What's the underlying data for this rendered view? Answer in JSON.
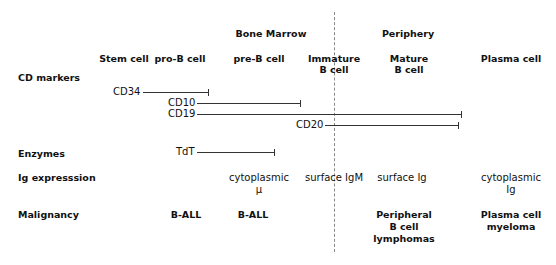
{
  "regions": {
    "bone_marrow": "Bone Marrow",
    "periphery": "Periphery"
  },
  "stages": [
    {
      "label": "Stem cell"
    },
    {
      "label": "pro-B cell"
    },
    {
      "label": "pre-B cell"
    },
    {
      "label": "Immature\nB cell",
      "line1": "Immature",
      "line2": "B cell"
    },
    {
      "label": "Mature\nB cell",
      "line1": "Mature",
      "line2": "B cell"
    },
    {
      "label": "Plasma cell"
    }
  ],
  "rows": {
    "cd_markers": "CD markers",
    "enzymes": "Enzymes",
    "ig_expression": "Ig expresssion",
    "malignancy": "Malignancy"
  },
  "markers": [
    {
      "name": "CD34",
      "from": "Stem cell",
      "to": "pro-B cell"
    },
    {
      "name": "CD10",
      "from": "pro-B cell",
      "to": "Immature B cell"
    },
    {
      "name": "CD19",
      "from": "pro-B cell",
      "to": "Mature B cell"
    },
    {
      "name": "CD20",
      "from": "Immature B cell",
      "to": "Mature B cell"
    }
  ],
  "enzymes": [
    {
      "name": "TdT",
      "from": "pro-B cell",
      "to": "pre-B cell"
    }
  ],
  "ig_expression": {
    "pre_b": {
      "line1": "cytoplasmic",
      "line2": "μ"
    },
    "immature": "surface IgM",
    "mature": "surface Ig",
    "plasma": {
      "line1": "cytoplasmic",
      "line2": "Ig"
    }
  },
  "malignancy": {
    "pro_b": "B-ALL",
    "pre_b": "B-ALL",
    "mature": {
      "line1": "Peripheral",
      "line2": "B cell",
      "line3": "lymphomas"
    },
    "plasma": {
      "line1": "Plasma cell",
      "line2": "myeloma"
    }
  }
}
